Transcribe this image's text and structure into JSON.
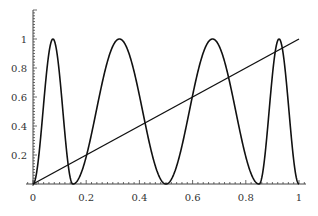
{
  "chart_data": {
    "type": "line",
    "title": "",
    "xlabel": "",
    "ylabel": "",
    "xlim": [
      0,
      1
    ],
    "ylim": [
      0,
      1.1
    ],
    "grid": false,
    "legend": null,
    "x_ticks": [
      "0",
      "0.2",
      "0.4",
      "0.6",
      "0.8",
      "1"
    ],
    "y_ticks": [
      "0.2",
      "0.4",
      "0.6",
      "0.8",
      "1"
    ],
    "series": [
      {
        "name": "oscillating curve",
        "description": "sin^2-like oscillation with 4 humps reaching 1",
        "peaks_x": [
          0.04,
          0.32,
          0.69,
          0.97
        ],
        "zeros_x": [
          0,
          0.15,
          0.5,
          0.85,
          1
        ],
        "phase_knots": {
          "x": [
            0,
            0.15,
            0.5,
            0.85,
            1
          ],
          "phase_pi": [
            0,
            1,
            2,
            3,
            4
          ]
        }
      },
      {
        "name": "line y=x",
        "x": [
          0,
          1
        ],
        "values": [
          0,
          1
        ]
      }
    ],
    "colors": {
      "curve": "#111111",
      "axis": "#333333"
    }
  }
}
